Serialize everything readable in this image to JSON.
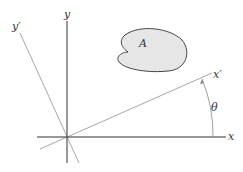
{
  "diagram": {
    "labels": {
      "x": "x",
      "y": "y",
      "x_prime": "x′",
      "y_prime": "y′",
      "area": "A",
      "angle": "θ"
    },
    "colors": {
      "axis": "#333333",
      "rotated_axis": "#9a9a9a",
      "area_fill": "#e6e6e6",
      "area_stroke": "#444444",
      "arc": "#888888"
    }
  }
}
